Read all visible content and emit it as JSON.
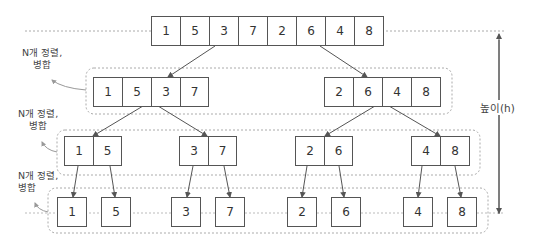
{
  "diagram": {
    "type": "merge-sort-tree",
    "levels": [
      {
        "name": "level-0",
        "groups": [
          [
            "1",
            "5",
            "3",
            "7",
            "2",
            "6",
            "4",
            "8"
          ]
        ]
      },
      {
        "name": "level-1",
        "groups": [
          [
            "1",
            "5",
            "3",
            "7"
          ],
          [
            "2",
            "6",
            "4",
            "8"
          ]
        ]
      },
      {
        "name": "level-2",
        "groups": [
          [
            "1",
            "5"
          ],
          [
            "3",
            "7"
          ],
          [
            "2",
            "6"
          ],
          [
            "4",
            "8"
          ]
        ]
      },
      {
        "name": "level-3",
        "groups": [
          [
            "1"
          ],
          [
            "5"
          ],
          [
            "3"
          ],
          [
            "7"
          ],
          [
            "2"
          ],
          [
            "6"
          ],
          [
            "4"
          ],
          [
            "8"
          ]
        ]
      }
    ],
    "annotations": {
      "step_label_1": "N개 정렬,",
      "step_label_2": "병합",
      "height_label": "높이(h)"
    },
    "colors": {
      "box_border": "#555555",
      "arrow": "#666666",
      "dashed": "#aaaaaa"
    }
  }
}
